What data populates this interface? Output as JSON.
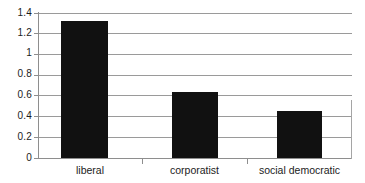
{
  "chart_data": {
    "type": "bar",
    "title": "",
    "subtitle": "",
    "xlabel": "",
    "ylabel": "",
    "categories": [
      "liberal",
      "corporatist",
      "social democratic"
    ],
    "values": [
      1.32,
      0.64,
      0.45
    ],
    "series": [
      {
        "name": "",
        "values": [
          1.32,
          0.64,
          0.45
        ]
      }
    ],
    "ylim": [
      0,
      1.4
    ],
    "ytick_labels": [
      "0",
      "0.2",
      "0.4",
      "0.6",
      "0.8",
      "1",
      "1.2",
      "1.4"
    ],
    "ytick_values": [
      0,
      0.2,
      0.4,
      0.6,
      0.8,
      1,
      1.2,
      1.4
    ],
    "grid": true,
    "grid_axis": "y",
    "legend": false,
    "legend_position": "none",
    "bar_color": "#111111",
    "gridline_color": "#9a9a9a",
    "axis_color": "#8e8e8e",
    "background_color": "#ffffff",
    "text_color": "#1c1c1c",
    "annotations": []
  }
}
